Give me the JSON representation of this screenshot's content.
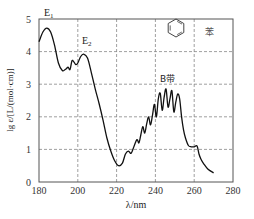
{
  "chart_data": {
    "type": "line",
    "title": "",
    "xlabel": "λ/nm",
    "ylabel": "lg ε/[L/(mol·cm)]",
    "xlim": [
      180,
      280
    ],
    "ylim": [
      0,
      5
    ],
    "xticks": [
      180,
      200,
      220,
      240,
      260,
      280
    ],
    "yticks": [
      0,
      1,
      2,
      3,
      4,
      5
    ],
    "grid": true,
    "grid_style": "dashed",
    "legend": null,
    "series": [
      {
        "name": "苯 (benzene) UV absorption spectrum",
        "x": [
          180,
          182,
          184,
          186,
          188,
          190,
          192,
          193.5,
          195,
          196,
          197,
          198,
          199,
          200,
          201.5,
          203,
          205,
          207,
          209,
          211,
          213,
          215,
          217,
          219,
          221,
          223,
          224.5,
          226,
          227.5,
          229,
          230.5,
          231.5,
          232.5,
          233.5,
          234.5,
          235.5,
          236.5,
          237.5,
          238.5,
          239.5,
          240.5,
          241.5,
          242.5,
          243.5,
          244.5,
          245.5,
          246.5,
          247.5,
          248.5,
          249.5,
          250.5,
          251.5,
          252.5,
          253.5,
          254.5,
          255.5,
          257,
          258.5,
          260,
          261.5,
          262.5,
          263.5,
          265,
          267,
          270
        ],
        "y": [
          4.3,
          4.6,
          4.72,
          4.6,
          4.2,
          3.65,
          3.42,
          3.45,
          3.52,
          3.45,
          3.72,
          3.68,
          3.6,
          3.65,
          3.85,
          3.92,
          3.8,
          3.35,
          2.85,
          2.4,
          1.9,
          1.35,
          0.95,
          0.65,
          0.5,
          0.58,
          0.85,
          0.95,
          0.88,
          1.1,
          1.3,
          1.2,
          1.45,
          1.7,
          1.5,
          1.78,
          2.0,
          1.75,
          2.05,
          2.38,
          2.0,
          2.55,
          2.72,
          2.2,
          2.6,
          2.85,
          2.3,
          2.55,
          2.8,
          2.15,
          2.45,
          2.7,
          2.55,
          2.0,
          1.6,
          1.35,
          1.12,
          1.08,
          1.08,
          1.1,
          0.85,
          0.7,
          0.55,
          0.4,
          0.28
        ]
      }
    ],
    "annotations": [
      {
        "text": "E₁",
        "x": 184,
        "y": 5.05
      },
      {
        "text": "E₂",
        "x": 204,
        "y": 4.25
      },
      {
        "text": "B带",
        "x": 244,
        "y": 3.05
      },
      {
        "text": "苯",
        "x": 269,
        "y": 4.55
      },
      {
        "text": "benzene-ring-structure",
        "x": 250,
        "y": 4.6
      }
    ]
  },
  "labels": {
    "e1": "E",
    "e1_sub": "1",
    "e2": "E",
    "e2_sub": "2",
    "b_band": "B带",
    "compound": "苯",
    "xlabel": "λ/nm",
    "ylabel": "lg ε/[L/(mol·cm)]"
  }
}
